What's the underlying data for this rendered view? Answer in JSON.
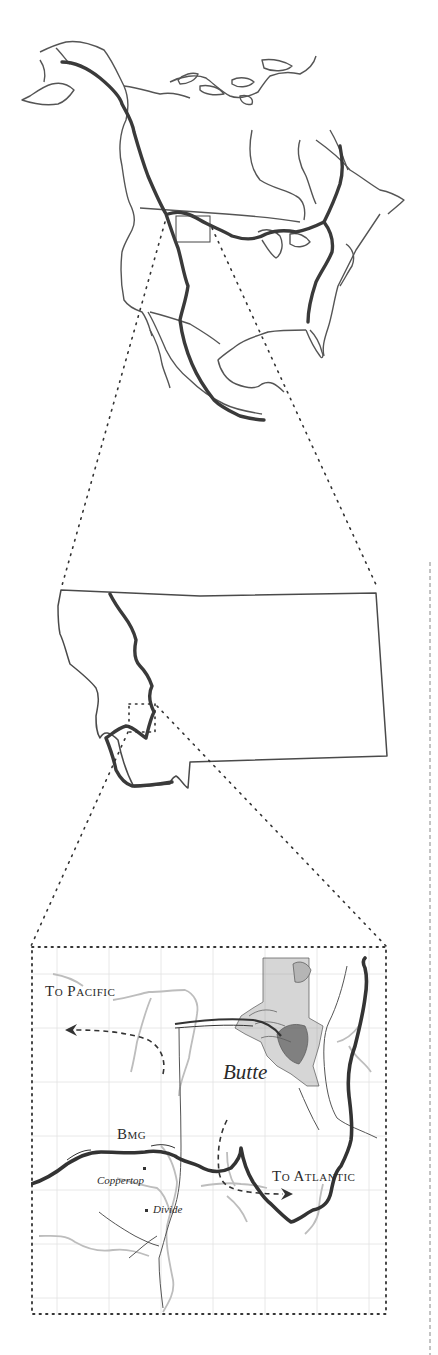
{
  "figure": {
    "type": "three-level zoom map",
    "levels": [
      {
        "name": "north-america",
        "description": "North America outline with Continental Divide in bold"
      },
      {
        "name": "montana",
        "description": "Montana state outline with Continental Divide in bold"
      },
      {
        "name": "butte-area",
        "description": "Local map near Butte with gridlines, rivers, roads and divide"
      }
    ]
  },
  "inset": {
    "labels": {
      "to_pacific": "To Pacific",
      "to_atlantic": "To Atlantic",
      "butte": "Butte",
      "bmg": "Bmg",
      "coppertop": "Coppertop",
      "divide": "Divide"
    }
  },
  "colors": {
    "divide": "#3a3a3a",
    "outline": "#555555",
    "river": "#bdbdbd",
    "grid": "#e2e2e2",
    "dotted": "#333333"
  }
}
